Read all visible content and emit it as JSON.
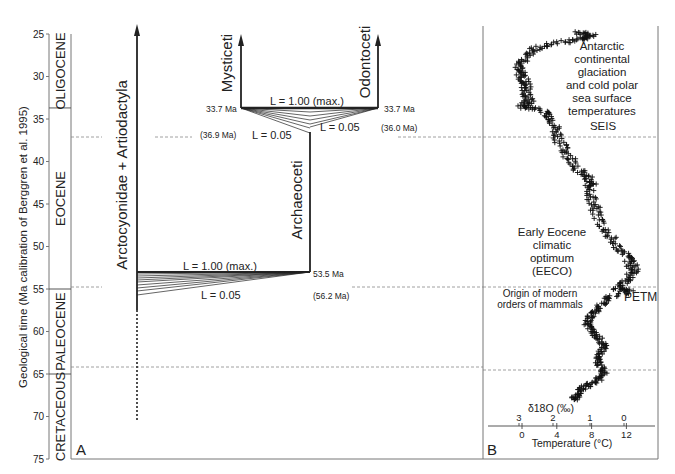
{
  "figure": {
    "y_axis_label": "Geological time (Ma calibration of Berggren et al. 1995)",
    "y_ticks": [
      25,
      30,
      35,
      40,
      45,
      50,
      55,
      60,
      65,
      70,
      75
    ],
    "epochs": [
      {
        "name": "OLIGOCENE",
        "from": 25,
        "to": 33.7
      },
      {
        "name": "EOCENE",
        "from": 33.7,
        "to": 55
      },
      {
        "name": "PALEOCENE",
        "from": 55,
        "to": 65
      },
      {
        "name": "CRETACEOUS",
        "from": 65,
        "to": 75
      }
    ],
    "boundaries_ma": [
      33.7,
      55,
      65
    ],
    "panel_a": {
      "label": "A",
      "lineages": {
        "arctocyonidae": "Arctocyonidae + Artiodactyla",
        "archaeoceti": "Archaeoceti",
        "mysticeti": "Mysticeti",
        "odontoceti": "Odontoceti"
      },
      "whale_split": {
        "max_label": "L = 1.00 (max.)",
        "min_label_left": "L = 0.05",
        "min_label_right": "L = 0.05",
        "left_age": "33.7 Ma",
        "right_age": "33.7 Ma",
        "left_alt_age": "(36.9 Ma)",
        "right_alt_age": "(36.0 Ma)"
      },
      "archaeoceti_split": {
        "max_label": "L = 1.00 (max.)",
        "min_label": "L = 0.05",
        "age": "53.5 Ma",
        "alt_age": "(56.2 Ma)"
      }
    },
    "panel_b": {
      "label": "B",
      "annotations": {
        "antarctic": [
          "Antarctic",
          "continental",
          "glaciation",
          "and cold polar",
          "sea surface",
          "temperatures"
        ],
        "seis": "SEIS",
        "eeco": [
          "Early Eocene",
          "climatic",
          "optimum",
          "(EECO)"
        ],
        "origin": [
          "Origin of modern",
          "orders of mammals"
        ],
        "petm": "PETM"
      },
      "d18o_label": "δ18O (‰)",
      "d18o_ticks": [
        "3",
        "2",
        "1",
        "0"
      ],
      "temp_ticks": [
        "0",
        "4",
        "8",
        "12"
      ],
      "temp_label": "Temperature (°C)"
    }
  },
  "chart_data": {
    "type": "scatter",
    "title": "",
    "panels": [
      {
        "id": "A",
        "type": "phylogeny-diagram",
        "ylabel": "Geological time (Ma calibration of Berggren et al. 1995)",
        "ylim": [
          75,
          25
        ],
        "lineages": [
          {
            "name": "Arctocyonidae + Artiodactyla",
            "from_ma": 71,
            "to_ma": 24.5
          },
          {
            "name": "Archaeoceti",
            "from_ma": 53.5,
            "to_ma": 33.7
          },
          {
            "name": "Mysticeti",
            "from_ma": 33.7,
            "to_ma": 24.5
          },
          {
            "name": "Odontoceti",
            "from_ma": 33.7,
            "to_ma": 24.5
          }
        ],
        "splits": [
          {
            "node": "Archaeoceti origin",
            "L_max_age_ma": 53.5,
            "L_min_age_ma": 56.2,
            "L_range": [
              0.05,
              1.0
            ]
          },
          {
            "node": "Mysticeti/Odontoceti",
            "L_max_age_ma": 33.7,
            "L_min_age_ma_left": 36.9,
            "L_min_age_ma_right": 36.0,
            "L_range": [
              0.05,
              1.0
            ]
          }
        ]
      },
      {
        "id": "B",
        "type": "scatter",
        "xlabel": "Temperature (°C)",
        "x2label": "δ18O (‰)",
        "ylabel": "Geological time (Ma)",
        "xlim": [
          -4,
          15
        ],
        "ylim": [
          75,
          25
        ],
        "x_ticks": [
          0,
          4,
          8,
          12
        ],
        "x2_ticks": [
          3,
          2,
          1,
          0
        ],
        "series": [
          {
            "name": "benthic δ18O-derived temperature",
            "points": [
              [
                6.5,
                24.8
              ],
              [
                8.0,
                25.2
              ],
              [
                7.0,
                25.6
              ],
              [
                4.0,
                26.0
              ],
              [
                1.5,
                26.8
              ],
              [
                0.5,
                28.0
              ],
              [
                -0.5,
                29.0
              ],
              [
                0.0,
                30.0
              ],
              [
                0.5,
                31.0
              ],
              [
                0.5,
                32.0
              ],
              [
                0.8,
                33.0
              ],
              [
                0.0,
                33.6
              ],
              [
                2.5,
                34.0
              ],
              [
                3.5,
                35.0
              ],
              [
                4.0,
                36.5
              ],
              [
                4.5,
                38.0
              ],
              [
                5.5,
                39.5
              ],
              [
                6.5,
                41.0
              ],
              [
                7.5,
                42.0
              ],
              [
                8.0,
                43.0
              ],
              [
                8.0,
                44.5
              ],
              [
                8.5,
                46.0
              ],
              [
                9.5,
                48.0
              ],
              [
                10.5,
                49.5
              ],
              [
                12.0,
                51.0
              ],
              [
                12.5,
                52.0
              ],
              [
                13.0,
                53.0
              ],
              [
                12.0,
                54.0
              ],
              [
                11.0,
                55.0
              ],
              [
                12.5,
                55.2
              ],
              [
                10.0,
                56.0
              ],
              [
                9.0,
                57.0
              ],
              [
                8.0,
                58.0
              ],
              [
                7.5,
                59.0
              ],
              [
                8.0,
                60.0
              ],
              [
                9.0,
                61.0
              ],
              [
                9.5,
                62.0
              ],
              [
                8.5,
                63.0
              ],
              [
                9.0,
                64.0
              ],
              [
                9.5,
                65.0
              ],
              [
                8.5,
                66.0
              ],
              [
                7.0,
                66.5
              ],
              [
                6.5,
                67.5
              ],
              [
                6.0,
                68.0
              ]
            ]
          }
        ],
        "annotations": [
          {
            "text": "Antarctic continental glaciation and cold polar sea surface temperatures",
            "ma": 29
          },
          {
            "text": "SEIS",
            "ma": 36
          },
          {
            "text": "Early Eocene climatic optimum (EECO)",
            "ma": 51
          },
          {
            "text": "Origin of modern orders of mammals",
            "ma": 56.5
          },
          {
            "text": "PETM",
            "ma": 56.2
          }
        ],
        "reference_lines_ma": [
          33.7,
          55,
          65
        ]
      }
    ]
  }
}
